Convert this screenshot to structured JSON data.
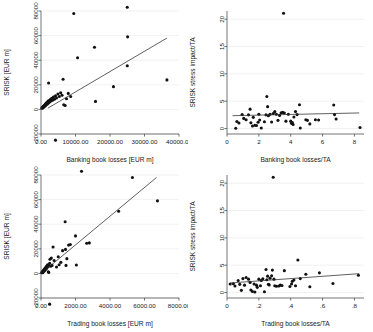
{
  "figure": {
    "panel_count": 4,
    "background_color": "#ffffff",
    "grid_color": "#e8e8e8",
    "point_color": "#111111",
    "fitline_color": "#2b2b2b"
  },
  "chart_data": [
    {
      "id": "panel-top-left",
      "type": "scatter",
      "title": "",
      "xlabel": "Banking book losses [EUR m]",
      "ylabel": "SRISK [EUR m]",
      "xlim": [
        0,
        40000
      ],
      "ylim": [
        -20000,
        80000
      ],
      "xticks": [
        0,
        10000,
        20000,
        30000,
        40000
      ],
      "xticklabels": [
        "0.00",
        "10000.00",
        "20000.00",
        "30000.00",
        "40000.00"
      ],
      "yticks": [
        -20000,
        0,
        20000,
        40000,
        60000,
        80000
      ],
      "yticklabels": [
        "-20000",
        "0",
        "20000",
        "40000",
        "60000",
        "80000"
      ],
      "grid": true,
      "legend": "none",
      "fit": {
        "type": "linear",
        "x0": 2000,
        "y0": 1000,
        "x1": 36500,
        "y1": 58000
      },
      "points": [
        [
          250,
          1200
        ],
        [
          330,
          900
        ],
        [
          420,
          1500
        ],
        [
          520,
          2000
        ],
        [
          600,
          1400
        ],
        [
          700,
          2600
        ],
        [
          780,
          1900
        ],
        [
          860,
          3000
        ],
        [
          950,
          2400
        ],
        [
          1050,
          3500
        ],
        [
          1150,
          2800
        ],
        [
          1250,
          4200
        ],
        [
          1350,
          3300
        ],
        [
          1450,
          5000
        ],
        [
          1550,
          3900
        ],
        [
          1700,
          5600
        ],
        [
          1850,
          4400
        ],
        [
          2000,
          6500
        ],
        [
          2150,
          5200
        ],
        [
          2300,
          7200
        ],
        [
          2500,
          6000
        ],
        [
          2700,
          8000
        ],
        [
          2900,
          6800
        ],
        [
          3100,
          9000
        ],
        [
          3350,
          7500
        ],
        [
          3600,
          10000
        ],
        [
          3900,
          8200
        ],
        [
          4200,
          11000
        ],
        [
          4500,
          9300
        ],
        [
          4900,
          12500
        ],
        [
          5300,
          10500
        ],
        [
          5700,
          13500
        ],
        [
          6100,
          11500
        ],
        [
          6600,
          3800
        ],
        [
          7000,
          3200
        ],
        [
          7400,
          8600
        ],
        [
          7900,
          13000
        ],
        [
          8600,
          10500
        ],
        [
          2200,
          21500
        ],
        [
          6400,
          24500
        ],
        [
          9500,
          78000
        ],
        [
          10600,
          42000
        ],
        [
          15500,
          50500
        ],
        [
          21000,
          18500
        ],
        [
          25000,
          83000
        ],
        [
          25100,
          59000
        ],
        [
          25000,
          35500
        ],
        [
          36500,
          24000
        ],
        [
          15800,
          6500
        ],
        [
          4200,
          -25000
        ]
      ]
    },
    {
      "id": "panel-top-right",
      "type": "scatter",
      "title": "",
      "xlabel": "Banking book losses/TA",
      "ylabel": "SRISK stress impact/TA",
      "xlim": [
        0,
        8.6
      ],
      "ylim": [
        -1,
        21.5
      ],
      "xticks": [
        0,
        2,
        4,
        6,
        8
      ],
      "xticklabels": [
        "0",
        "2",
        "4",
        "6",
        "8"
      ],
      "yticks": [
        0,
        5,
        10,
        15,
        20
      ],
      "yticklabels": [
        "0",
        "5",
        "10",
        "15",
        "20"
      ],
      "grid": true,
      "legend": "none",
      "fit": {
        "type": "linear",
        "x0": 0.35,
        "y0": 2.35,
        "x1": 8.3,
        "y1": 2.85
      },
      "points": [
        [
          0.55,
          0.05
        ],
        [
          0.62,
          1.3
        ],
        [
          0.75,
          1.0
        ],
        [
          0.95,
          2.55
        ],
        [
          1.05,
          1.85
        ],
        [
          1.2,
          1.6
        ],
        [
          1.35,
          2.5
        ],
        [
          1.45,
          3.55
        ],
        [
          1.5,
          1.05
        ],
        [
          1.6,
          0.45
        ],
        [
          1.65,
          2.05
        ],
        [
          1.75,
          0.6
        ],
        [
          1.85,
          0.55
        ],
        [
          1.95,
          1.15
        ],
        [
          2.0,
          2.6
        ],
        [
          2.05,
          1.55
        ],
        [
          2.15,
          0.1
        ],
        [
          2.35,
          1.25
        ],
        [
          2.45,
          2.5
        ],
        [
          2.5,
          5.85
        ],
        [
          2.55,
          4.0
        ],
        [
          2.6,
          2.35
        ],
        [
          2.7,
          2.6
        ],
        [
          2.8,
          1.2
        ],
        [
          2.9,
          2.75
        ],
        [
          3.0,
          3.1
        ],
        [
          3.1,
          2.6
        ],
        [
          3.2,
          1.5
        ],
        [
          3.3,
          2.4
        ],
        [
          3.4,
          2.9
        ],
        [
          3.5,
          2.95
        ],
        [
          3.55,
          21.1
        ],
        [
          3.6,
          2.85
        ],
        [
          3.7,
          1.35
        ],
        [
          3.85,
          2.6
        ],
        [
          4.0,
          1.35
        ],
        [
          4.05,
          0.95
        ],
        [
          4.1,
          1.1
        ],
        [
          4.15,
          0.75
        ],
        [
          4.2,
          2.1
        ],
        [
          4.3,
          3.1
        ],
        [
          4.4,
          2.55
        ],
        [
          4.55,
          4.35
        ],
        [
          4.6,
          0.1
        ],
        [
          4.95,
          1.6
        ],
        [
          5.05,
          1.5
        ],
        [
          5.2,
          0.85
        ],
        [
          5.55,
          1.6
        ],
        [
          5.75,
          1.55
        ],
        [
          6.7,
          4.3
        ],
        [
          6.75,
          2.55
        ],
        [
          6.85,
          1.75
        ],
        [
          8.35,
          0.2
        ]
      ]
    },
    {
      "id": "panel-bottom-left",
      "type": "scatter",
      "title": "",
      "xlabel": "Trading book losses [EUR m]",
      "ylabel": "SRISK [EUR m]",
      "xlim": [
        0,
        8000
      ],
      "ylim": [
        -20000,
        80000
      ],
      "xticks": [
        0,
        2000,
        4000,
        6000,
        8000
      ],
      "xticklabels": [
        "0.00",
        "2000.00",
        "4000.00",
        "6000.00",
        "8000.00"
      ],
      "yticks": [
        -20000,
        0,
        20000,
        40000,
        60000,
        80000
      ],
      "yticklabels": [
        "-20000",
        "0",
        "20000",
        "40000",
        "60000",
        "80000"
      ],
      "grid": true,
      "legend": "none",
      "fit": {
        "type": "linear",
        "x0": 100,
        "y0": 1000,
        "x1": 6700,
        "y1": 78000
      },
      "points": [
        [
          40,
          500
        ],
        [
          60,
          900
        ],
        [
          80,
          1400
        ],
        [
          95,
          600
        ],
        [
          110,
          2000
        ],
        [
          130,
          1200
        ],
        [
          150,
          2600
        ],
        [
          165,
          1700
        ],
        [
          180,
          3200
        ],
        [
          200,
          2300
        ],
        [
          215,
          3800
        ],
        [
          235,
          2900
        ],
        [
          250,
          4400
        ],
        [
          270,
          3400
        ],
        [
          290,
          5200
        ],
        [
          310,
          4000
        ],
        [
          330,
          6000
        ],
        [
          350,
          4700
        ],
        [
          380,
          7000
        ],
        [
          400,
          5400
        ],
        [
          420,
          1300
        ],
        [
          450,
          800
        ],
        [
          470,
          6300
        ],
        [
          500,
          8200
        ],
        [
          520,
          11500
        ],
        [
          560,
          5800
        ],
        [
          600,
          12500
        ],
        [
          640,
          6500
        ],
        [
          700,
          21500
        ],
        [
          760,
          10500
        ],
        [
          900,
          5200
        ],
        [
          1000,
          13500
        ],
        [
          1050,
          7000
        ],
        [
          1150,
          9000
        ],
        [
          1250,
          18500
        ],
        [
          1400,
          42000
        ],
        [
          1420,
          19500
        ],
        [
          1450,
          6500
        ],
        [
          1500,
          12000
        ],
        [
          1600,
          23000
        ],
        [
          1700,
          23500
        ],
        [
          2000,
          30500
        ],
        [
          2050,
          6800
        ],
        [
          2350,
          83000
        ],
        [
          2650,
          24500
        ],
        [
          2800,
          24800
        ],
        [
          4500,
          50500
        ],
        [
          5300,
          78000
        ],
        [
          6750,
          59000
        ],
        [
          500,
          -25000
        ]
      ]
    },
    {
      "id": "panel-bottom-right",
      "type": "scatter",
      "title": "",
      "xlabel": "Trading book losses/TA",
      "ylabel": "SRISK stress impact/TA",
      "xlim": [
        0,
        0.86
      ],
      "ylim": [
        -1,
        21.5
      ],
      "xticks": [
        0,
        0.2,
        0.4,
        0.6,
        0.8
      ],
      "xticklabels": [
        "0",
        ".2",
        ".4",
        ".6",
        ".8"
      ],
      "yticks": [
        0,
        5,
        10,
        15,
        20
      ],
      "yticklabels": [
        "0",
        "5",
        "10",
        "15",
        "20"
      ],
      "grid": true,
      "legend": "none",
      "fit": {
        "type": "linear",
        "x0": 0.02,
        "y0": 1.75,
        "x1": 0.83,
        "y1": 3.45
      },
      "points": [
        [
          0.02,
          1.55
        ],
        [
          0.04,
          1.6
        ],
        [
          0.05,
          1.2
        ],
        [
          0.07,
          2.2
        ],
        [
          0.08,
          1.5
        ],
        [
          0.09,
          0.4
        ],
        [
          0.1,
          2.55
        ],
        [
          0.11,
          1.35
        ],
        [
          0.12,
          2.75
        ],
        [
          0.135,
          2.45
        ],
        [
          0.145,
          1.85
        ],
        [
          0.15,
          0.45
        ],
        [
          0.16,
          0.2
        ],
        [
          0.17,
          1.55
        ],
        [
          0.175,
          0.1
        ],
        [
          0.185,
          1.35
        ],
        [
          0.19,
          0.95
        ],
        [
          0.2,
          2.45
        ],
        [
          0.21,
          1.25
        ],
        [
          0.215,
          2.2
        ],
        [
          0.225,
          2.5
        ],
        [
          0.235,
          0.15
        ],
        [
          0.245,
          4.2
        ],
        [
          0.25,
          2.35
        ],
        [
          0.255,
          3.0
        ],
        [
          0.26,
          1.5
        ],
        [
          0.265,
          1.4
        ],
        [
          0.27,
          2.6
        ],
        [
          0.28,
          3.05
        ],
        [
          0.285,
          4.1
        ],
        [
          0.29,
          21.1
        ],
        [
          0.295,
          2.45
        ],
        [
          0.3,
          1.25
        ],
        [
          0.31,
          1.15
        ],
        [
          0.325,
          1.2
        ],
        [
          0.335,
          1.35
        ],
        [
          0.345,
          1.3
        ],
        [
          0.36,
          4.0
        ],
        [
          0.395,
          1.1
        ],
        [
          0.405,
          1.55
        ],
        [
          0.41,
          2.05
        ],
        [
          0.42,
          2.3
        ],
        [
          0.43,
          1.25
        ],
        [
          0.445,
          5.95
        ],
        [
          0.46,
          2.55
        ],
        [
          0.495,
          3.35
        ],
        [
          0.52,
          1.05
        ],
        [
          0.58,
          3.6
        ],
        [
          0.665,
          1.65
        ],
        [
          0.825,
          3.15
        ]
      ]
    }
  ]
}
